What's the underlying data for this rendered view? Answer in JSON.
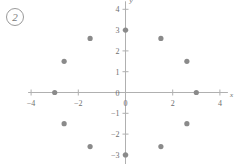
{
  "problem": {
    "number": "2"
  },
  "chart_data": {
    "type": "scatter",
    "title": "",
    "xlabel": "x",
    "ylabel": "y",
    "xlim": [
      -4,
      4
    ],
    "ylim": [
      -4,
      4
    ],
    "grid": false,
    "legend": null,
    "xticks": [
      -4,
      -2,
      0,
      2,
      4
    ],
    "xtick_labels": [
      "−4",
      "−2",
      "0",
      "2",
      "4"
    ],
    "yticks": [
      -4,
      -3,
      -2,
      -1,
      0,
      1,
      2,
      3,
      4
    ],
    "ytick_labels": [
      "−4",
      "−3",
      "−2",
      "−1",
      "0",
      "1",
      "2",
      "3",
      "4"
    ],
    "point_color": "#8a8a8a",
    "axis_color": "#b0b0b0",
    "marker_size": 2.6,
    "points": [
      {
        "x": 3.0,
        "y": 0.0
      },
      {
        "x": 2.6,
        "y": 1.5
      },
      {
        "x": 1.5,
        "y": 2.6
      },
      {
        "x": 0.0,
        "y": 3.0
      },
      {
        "x": -1.5,
        "y": 2.6
      },
      {
        "x": -2.6,
        "y": 1.5
      },
      {
        "x": -3.0,
        "y": 0.0
      },
      {
        "x": -2.6,
        "y": -1.5
      },
      {
        "x": -1.5,
        "y": -2.6
      },
      {
        "x": 0.0,
        "y": -3.0
      },
      {
        "x": 1.5,
        "y": -2.6
      },
      {
        "x": 2.6,
        "y": -1.5
      }
    ]
  }
}
